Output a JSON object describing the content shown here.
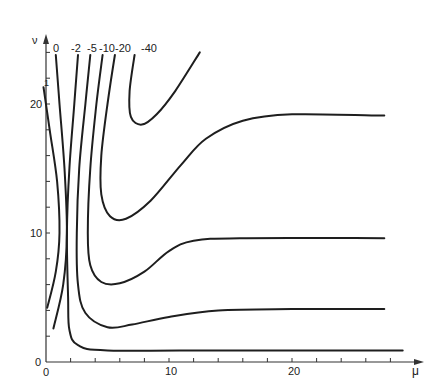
{
  "chart_data": {
    "type": "line",
    "subtype": "contour",
    "title": "",
    "xlabel": "μ",
    "ylabel": "ν",
    "xlim": [
      0,
      29
    ],
    "ylim": [
      0,
      25
    ],
    "grid": false,
    "legend": "inline labels at top of each contour",
    "x_ticks": [
      0,
      2,
      4,
      6,
      8,
      10,
      12,
      14,
      16,
      18,
      20,
      22,
      24,
      26,
      28
    ],
    "x_tick_labels": [
      "0",
      "10",
      "20"
    ],
    "x_tick_label_values": [
      0,
      10,
      20
    ],
    "y_ticks": [
      0,
      2,
      4,
      6,
      8,
      10,
      12,
      14,
      16,
      18,
      20,
      22,
      24
    ],
    "y_tick_labels": [
      "0",
      "10",
      "20"
    ],
    "y_tick_label_values": [
      0,
      10,
      20
    ],
    "series": [
      {
        "name": "1",
        "label": "1",
        "points": [
          [
            -0.2,
            21.3
          ],
          [
            0.3,
            18
          ],
          [
            0.9,
            14
          ],
          [
            1.1,
            10
          ],
          [
            0.8,
            7
          ],
          [
            0.1,
            4.2
          ]
        ]
      },
      {
        "name": "0",
        "label": "0",
        "points": [
          [
            0.8,
            23.8
          ],
          [
            1.1,
            20
          ],
          [
            1.5,
            15
          ],
          [
            1.7,
            10
          ],
          [
            1.4,
            6
          ],
          [
            0.6,
            2.6
          ]
        ]
      },
      {
        "name": "-2",
        "label": "-2",
        "points": [
          [
            2.6,
            23.8
          ],
          [
            2.3,
            20
          ],
          [
            1.9,
            15
          ],
          [
            1.7,
            10
          ],
          [
            1.8,
            5
          ],
          [
            1.9,
            2.5
          ],
          [
            2.6,
            1.3
          ],
          [
            5,
            0.9
          ],
          [
            15,
            0.9
          ],
          [
            29,
            0.9
          ]
        ]
      },
      {
        "name": "-5",
        "label": "-5",
        "points": [
          [
            3.6,
            23.8
          ],
          [
            3.2,
            20
          ],
          [
            2.7,
            15
          ],
          [
            2.5,
            10
          ],
          [
            2.6,
            6
          ],
          [
            3.2,
            3.8
          ],
          [
            5,
            2.7
          ],
          [
            7,
            2.9
          ],
          [
            10,
            3.5
          ],
          [
            14,
            4.0
          ],
          [
            20,
            4.1
          ],
          [
            27.5,
            4.1
          ]
        ]
      },
      {
        "name": "-10",
        "label": "-10",
        "points": [
          [
            4.6,
            23.8
          ],
          [
            4.1,
            20
          ],
          [
            3.6,
            15
          ],
          [
            3.4,
            10
          ],
          [
            3.6,
            7.5
          ],
          [
            4.5,
            6.2
          ],
          [
            6,
            6.1
          ],
          [
            8,
            7
          ],
          [
            10,
            8.6
          ],
          [
            12,
            9.4
          ],
          [
            16,
            9.6
          ],
          [
            27.5,
            9.6
          ]
        ]
      },
      {
        "name": "-20",
        "label": "-20",
        "points": [
          [
            5.6,
            23.8
          ],
          [
            5.0,
            20
          ],
          [
            4.5,
            16
          ],
          [
            4.5,
            13
          ],
          [
            5.2,
            11.3
          ],
          [
            6.5,
            11.1
          ],
          [
            8.5,
            12.5
          ],
          [
            11,
            15.3
          ],
          [
            13,
            17.3
          ],
          [
            16,
            18.7
          ],
          [
            20,
            19.2
          ],
          [
            27.5,
            19.1
          ]
        ]
      },
      {
        "name": "-40",
        "label": "-40",
        "points": [
          [
            7.2,
            23.8
          ],
          [
            6.8,
            21
          ],
          [
            6.9,
            19.0
          ],
          [
            7.8,
            18.4
          ],
          [
            9,
            19.2
          ],
          [
            10.5,
            21
          ],
          [
            12.5,
            24.0
          ]
        ]
      }
    ]
  },
  "axes": {
    "x_label": "μ",
    "y_label": "ν",
    "origin_x_label": "0",
    "origin_y_label": "0",
    "x_label_10": "10",
    "x_label_20": "20",
    "y_label_10": "10",
    "y_label_20": "20"
  },
  "colors": {
    "line": "#1e1e1e",
    "axis": "#333333",
    "background": "#ffffff"
  }
}
